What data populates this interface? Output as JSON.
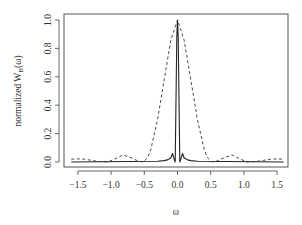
{
  "chart_data": {
    "type": "line",
    "title": "",
    "xlabel": "ω",
    "ylabel": "normalized W_B(ω)",
    "ylabel_main": "normalized W",
    "ylabel_sub": "B",
    "ylabel_tail": "(ω)",
    "xlim": [
      -1.6,
      1.6
    ],
    "ylim": [
      0.0,
      1.0
    ],
    "xticks": [
      -1.5,
      -1.0,
      -0.5,
      0.0,
      0.5,
      1.0,
      1.5
    ],
    "xtick_labels": [
      "-1.5",
      "-1.0",
      "-0.5",
      "0.0",
      "0.5",
      "1.0",
      "1.5"
    ],
    "yticks": [
      0.0,
      0.2,
      0.4,
      0.6,
      0.8,
      1.0
    ],
    "ytick_labels": [
      "0.0",
      "0.2",
      "0.4",
      "0.6",
      "0.8",
      "1.0"
    ],
    "grid": false,
    "legend": null,
    "series": [
      {
        "name": "narrow window (solid)",
        "style": "solid",
        "color": "#222222",
        "description": "sharp peak at ω=0 reaching 1.0, first zeros near ±0.04, small side ripples ≤0.06 up to |ω|≈0.3",
        "x": [
          -1.6,
          -0.3,
          -0.2,
          -0.15,
          -0.1,
          -0.075,
          -0.05,
          -0.035,
          -0.02,
          -0.01,
          0.0,
          0.01,
          0.02,
          0.035,
          0.05,
          0.075,
          0.1,
          0.15,
          0.2,
          0.3,
          1.6
        ],
        "y": [
          0.0,
          0.005,
          0.01,
          0.015,
          0.03,
          0.06,
          0.02,
          0.0,
          0.55,
          0.88,
          1.0,
          0.88,
          0.55,
          0.0,
          0.02,
          0.06,
          0.03,
          0.015,
          0.01,
          0.005,
          0.0
        ]
      },
      {
        "name": "wide window (dashed)",
        "style": "dashed",
        "color": "#333333",
        "description": "broad main lobe peaking at 1.0 at ω=0 with zeros near ±0.52; side lobes ~0.05 at ±0.82 and ~0.02 at ±1.45",
        "x": [
          -1.6,
          -1.5,
          -1.4,
          -1.3,
          -1.2,
          -1.05,
          -0.95,
          -0.82,
          -0.7,
          -0.6,
          -0.52,
          -0.45,
          -0.4,
          -0.3,
          -0.2,
          -0.1,
          0.0,
          0.1,
          0.2,
          0.3,
          0.4,
          0.45,
          0.52,
          0.6,
          0.7,
          0.82,
          0.95,
          1.05,
          1.2,
          1.3,
          1.4,
          1.5,
          1.6
        ],
        "y": [
          0.02,
          0.022,
          0.02,
          0.012,
          0.004,
          0.0,
          0.02,
          0.05,
          0.03,
          0.008,
          0.0,
          0.03,
          0.09,
          0.3,
          0.58,
          0.86,
          1.0,
          0.86,
          0.58,
          0.3,
          0.09,
          0.03,
          0.0,
          0.008,
          0.03,
          0.05,
          0.02,
          0.0,
          0.004,
          0.012,
          0.02,
          0.022,
          0.02
        ]
      }
    ]
  },
  "plot": {
    "x_axis_title": "ω",
    "y_axis_title": "normalized W",
    "y_axis_title_sub": "B",
    "y_axis_title_tail": "(ω)"
  }
}
